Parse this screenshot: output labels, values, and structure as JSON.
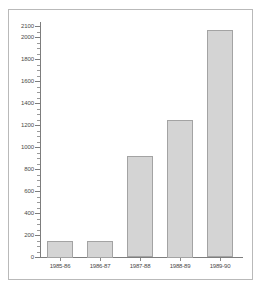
{
  "chart_data": {
    "type": "bar",
    "title": "",
    "subtitle": "",
    "xlabel": "",
    "ylabel": "",
    "categories": [
      "1985-86",
      "1986-87",
      "1987-88",
      "1988-89",
      "1989-90"
    ],
    "values": [
      150,
      150,
      920,
      1250,
      2060
    ],
    "series": [
      {
        "name": "",
        "values": [
          150,
          150,
          920,
          1250,
          2060
        ]
      }
    ],
    "ylim": [
      0,
      2100
    ],
    "ytick_labels": [
      "0",
      "200",
      "400",
      "600",
      "800",
      "1000",
      "1200",
      "1400",
      "1600",
      "1800",
      "2000",
      "2100"
    ],
    "ytick_values": [
      0,
      200,
      400,
      600,
      800,
      1000,
      1200,
      1400,
      1600,
      1800,
      2000,
      2100
    ],
    "minor_ticks": true,
    "minor_tick_step": 50,
    "grid": false,
    "legend": null,
    "legend_position": "none",
    "annotations": [],
    "colors": {
      "bar_fill": "#d4d4d4",
      "bar_edge": "#a3a3a3",
      "axis": "#7d7d7d",
      "text": "#4a4a4a",
      "frame": "#b9b9b9",
      "background": "#ffffff"
    }
  }
}
